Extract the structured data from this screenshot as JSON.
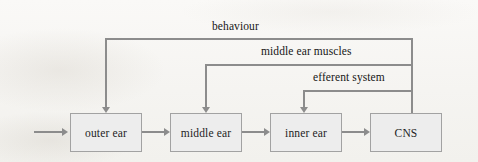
{
  "diagram": {
    "background_color": "#f7f6f3",
    "box_fill_color": "#ededed",
    "box_border_color": "#a2a2a2",
    "line_color": "#8c8c8c",
    "text_color": "#1d1d1d",
    "nodes": [
      {
        "id": "outer_ear",
        "label": "outer ear",
        "x": 70,
        "y": 113,
        "width": 72,
        "height": 39
      },
      {
        "id": "middle_ear",
        "label": "middle ear",
        "x": 170,
        "y": 113,
        "width": 72,
        "height": 39
      },
      {
        "id": "inner_ear",
        "label": "inner ear",
        "x": 270,
        "y": 113,
        "width": 72,
        "height": 39
      },
      {
        "id": "cns",
        "label": "CNS",
        "x": 370,
        "y": 113,
        "width": 72,
        "height": 39
      }
    ],
    "feedback_labels": [
      {
        "id": "behaviour",
        "label": "behaviour",
        "x": 250,
        "y": 27,
        "target": "outer ear"
      },
      {
        "id": "middle_ear_muscles",
        "label": "middle ear muscles",
        "x": 320,
        "y": 52,
        "target": "middle ear"
      },
      {
        "id": "efferent_system",
        "label": "efferent system",
        "x": 355,
        "y": 78,
        "target": "inner ear"
      }
    ],
    "forward_flow": [
      {
        "from": "input",
        "to": "outer ear"
      },
      {
        "from": "outer ear",
        "to": "middle ear"
      },
      {
        "from": "middle ear",
        "to": "inner ear"
      },
      {
        "from": "inner ear",
        "to": "CNS"
      }
    ],
    "feedback_flow": [
      {
        "from": "CNS",
        "to": "outer ear",
        "via": "behaviour"
      },
      {
        "from": "CNS",
        "to": "middle ear",
        "via": "middle ear muscles"
      },
      {
        "from": "CNS",
        "to": "inner ear",
        "via": "efferent system"
      }
    ]
  }
}
